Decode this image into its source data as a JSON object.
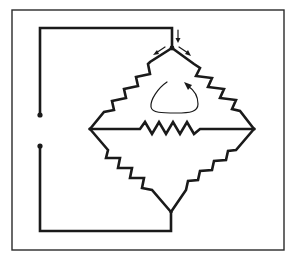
{
  "diagram": {
    "type": "circuit-schematic",
    "title": "",
    "colors": {
      "ink": "#1a1a1a",
      "background": "#ffffff",
      "frame": "#2a2a2a"
    },
    "frame": {
      "x": 12,
      "y": 10,
      "width": 272,
      "height": 240
    },
    "nodes": [
      {
        "id": "top",
        "x": 172,
        "y": 48
      },
      {
        "id": "left",
        "x": 90,
        "y": 129
      },
      {
        "id": "right",
        "x": 254,
        "y": 129
      },
      {
        "id": "bottom",
        "x": 171,
        "y": 212
      },
      {
        "id": "terminal-upper",
        "x": 40,
        "y": 115
      },
      {
        "id": "terminal-lower",
        "x": 40,
        "y": 146
      }
    ],
    "resistors": [
      {
        "id": "R-top-left",
        "from": "top",
        "to": "left"
      },
      {
        "id": "R-top-right",
        "from": "top",
        "to": "right"
      },
      {
        "id": "R-bridge",
        "from": "left",
        "to": "right"
      },
      {
        "id": "R-bottom-left",
        "from": "left",
        "to": "bottom"
      },
      {
        "id": "R-bottom-right",
        "from": "right",
        "to": "bottom"
      }
    ],
    "wires": [
      {
        "id": "feed-upper",
        "points": [
          [
            40,
            115
          ],
          [
            40,
            28
          ],
          [
            172,
            28
          ],
          [
            172,
            48
          ]
        ]
      },
      {
        "id": "feed-lower",
        "points": [
          [
            40,
            146
          ],
          [
            40,
            231
          ],
          [
            171,
            231
          ],
          [
            171,
            212
          ]
        ]
      }
    ],
    "annotations": [
      {
        "id": "current-in-arrow",
        "kind": "arrow",
        "direction": "down"
      },
      {
        "id": "current-split-left-arrow",
        "kind": "arrow",
        "direction": "down-left"
      },
      {
        "id": "current-split-right-arrow",
        "kind": "arrow",
        "direction": "down-right"
      },
      {
        "id": "loop-circulation-arrow",
        "kind": "loop-arrow",
        "direction": "clockwise"
      }
    ]
  }
}
